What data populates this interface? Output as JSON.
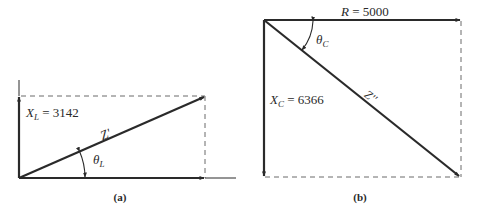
{
  "figure_a": {
    "caption": "(a)",
    "xl_label": {
      "symbol": "X",
      "sub": "L",
      "value": " = 3142"
    },
    "z_label": "Z'",
    "theta_label": {
      "symbol": "θ",
      "sub": "L"
    }
  },
  "figure_b": {
    "caption": "(b)",
    "r_label": {
      "symbol": "R",
      "value": " = 5000"
    },
    "xc_label": {
      "symbol": "X",
      "sub": "C",
      "value": " = 6366"
    },
    "z_label": "Z''",
    "theta_label": {
      "symbol": "θ",
      "sub": "C"
    }
  },
  "colors": {
    "line": "#2a2a2a",
    "dash": "#6a6a6a",
    "background": "#ffffff"
  }
}
